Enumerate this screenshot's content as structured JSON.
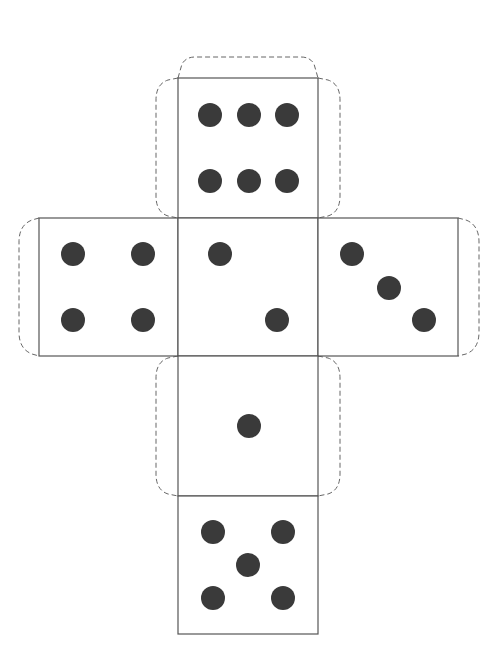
{
  "colors": {
    "line": "#555555",
    "pip": "#3a3a3a",
    "tab": "#666666",
    "background": "#ffffff"
  },
  "faces": [
    {
      "id": "top",
      "value": 6,
      "x": 178,
      "y": 78,
      "w": 140,
      "h": 140,
      "pips": [
        [
          210,
          115
        ],
        [
          249,
          115
        ],
        [
          287,
          115
        ],
        [
          210,
          181
        ],
        [
          249,
          181
        ],
        [
          287,
          181
        ]
      ]
    },
    {
      "id": "left",
      "value": 4,
      "x": 39,
      "y": 218,
      "w": 139,
      "h": 138,
      "pips": [
        [
          73,
          254
        ],
        [
          143,
          254
        ],
        [
          73,
          320
        ],
        [
          143,
          320
        ]
      ]
    },
    {
      "id": "center",
      "value": 2,
      "x": 178,
      "y": 218,
      "w": 140,
      "h": 138,
      "pips": [
        [
          220,
          254
        ],
        [
          277,
          320
        ]
      ]
    },
    {
      "id": "right",
      "value": 3,
      "x": 318,
      "y": 218,
      "w": 140,
      "h": 138,
      "pips": [
        [
          352,
          254
        ],
        [
          389,
          288
        ],
        [
          424,
          320
        ]
      ]
    },
    {
      "id": "lower",
      "value": 1,
      "x": 178,
      "y": 356,
      "w": 140,
      "h": 140,
      "pips": [
        [
          249,
          426
        ]
      ]
    },
    {
      "id": "bottom",
      "value": 5,
      "x": 178,
      "y": 496,
      "w": 140,
      "h": 138,
      "pips": [
        [
          213,
          532
        ],
        [
          283,
          532
        ],
        [
          248,
          565
        ],
        [
          213,
          598
        ],
        [
          283,
          598
        ]
      ]
    }
  ],
  "pip_radius": 12,
  "tabs": [
    {
      "id": "top-face-top-tab",
      "d": "M178,78 L182,64 Q186,57 195,57 L301,57 Q310,57 314,64 L318,78"
    },
    {
      "id": "top-face-left-tab",
      "d": "M178,78 L168,80 Q156,84 156,100 L156,196 Q156,212 168,216 L178,218"
    },
    {
      "id": "top-face-right-tab",
      "d": "M318,78 L328,80 Q340,84 340,100 L340,196 Q340,212 328,216 L318,218"
    },
    {
      "id": "left-face-left-tab",
      "d": "M39,218 L32,220 Q19,225 19,242 L19,332 Q19,349 32,354 L39,356"
    },
    {
      "id": "right-face-right-tab",
      "d": "M458,218 L466,220 Q479,225 479,242 L479,332 Q479,349 466,354 L458,356"
    },
    {
      "id": "lower-face-left-tab",
      "d": "M178,356 L168,358 Q156,362 156,378 L156,474 Q156,490 168,494 L178,496"
    },
    {
      "id": "lower-face-right-tab",
      "d": "M318,356 L328,358 Q340,362 340,378 L340,474 Q340,490 328,494 L318,496"
    }
  ]
}
